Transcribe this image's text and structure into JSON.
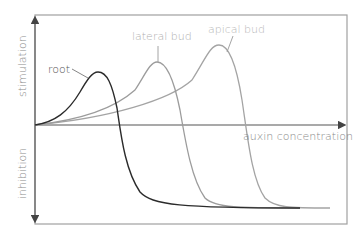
{
  "diagram": {
    "axes": {
      "x_label": "auxin concentration",
      "y_label_top": "stimulation",
      "y_label_bottom": "inhibition"
    },
    "curves": [
      {
        "name": "root",
        "label": "root",
        "color": "#2b2b2b",
        "peak": [
          98,
          72
        ]
      },
      {
        "name": "lateral-bud",
        "label": "lateral bud",
        "color": "#9a9a9a",
        "peak": [
          157,
          62
        ]
      },
      {
        "name": "apical-bud",
        "label": "apical bud",
        "color": "#8c8c8c",
        "peak": [
          219,
          45
        ]
      }
    ],
    "colors": {
      "frame": "#9a9a9a",
      "axis": "#555555",
      "root_line": "#2b2b2b",
      "lateral_bud_line": "#a8a8a8",
      "apical_bud_line": "#9a9a9a",
      "label_text": "#8a8a8a"
    }
  }
}
